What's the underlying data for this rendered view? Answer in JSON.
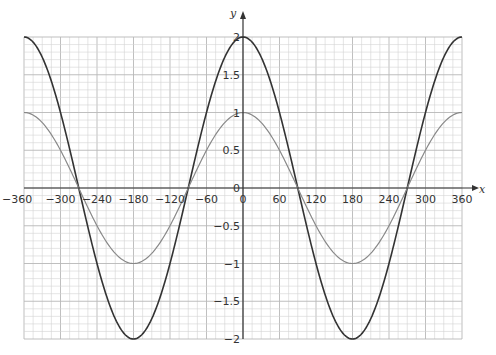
{
  "chart_data": {
    "type": "line",
    "title": "",
    "xlabel": "x",
    "ylabel": "y",
    "xlim": [
      -360,
      360
    ],
    "ylim": [
      -2,
      2
    ],
    "grid": true,
    "grid_minor_x": 15,
    "grid_major_x": 60,
    "grid_minor_y": 0.1,
    "grid_major_y": 0.5,
    "x_ticks": [
      -360,
      -300,
      -240,
      -180,
      -120,
      -60,
      0,
      60,
      120,
      180,
      240,
      300,
      360
    ],
    "x_tick_labels": [
      "−360",
      "−300",
      "−240",
      "−180",
      "−120",
      "−60",
      "0",
      "60",
      "120",
      "180",
      "240",
      "300",
      "360"
    ],
    "y_ticks": [
      2,
      1.5,
      1,
      0.5,
      0,
      -0.5,
      -1,
      -1.5,
      -2
    ],
    "y_tick_labels": [
      "2",
      "1.5",
      "1",
      "0.5",
      "0",
      "−0.5",
      "−1",
      "−1.5",
      "−2"
    ],
    "legend": null,
    "series": [
      {
        "name": "y = 2cos x",
        "color": "#333333",
        "x": [
          -360,
          -300,
          -270,
          -240,
          -180,
          -120,
          -90,
          -60,
          0,
          60,
          90,
          120,
          180,
          240,
          270,
          300,
          360
        ],
        "values": [
          2,
          1,
          0,
          -1,
          -2,
          -1,
          0,
          1,
          2,
          1,
          0,
          -1,
          -2,
          -1,
          0,
          1,
          2
        ]
      },
      {
        "name": "y = cos x",
        "color": "#888888",
        "x": [
          -360,
          -300,
          -270,
          -240,
          -180,
          -120,
          -90,
          -60,
          0,
          60,
          90,
          120,
          180,
          240,
          270,
          300,
          360
        ],
        "values": [
          1,
          0.5,
          0,
          -0.5,
          -1,
          -0.5,
          0,
          0.5,
          1,
          0.5,
          0,
          -0.5,
          -1,
          -0.5,
          0,
          0.5,
          1
        ]
      }
    ]
  },
  "colors": {
    "grid_minor": "#d4d4d4",
    "grid_major": "#b8b8b8",
    "axis": "#333333"
  }
}
